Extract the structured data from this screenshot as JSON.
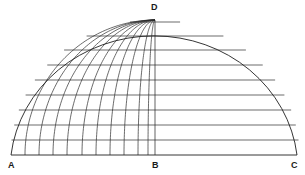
{
  "figure": {
    "type": "geometric-diagram",
    "background_color": "#ffffff",
    "line_color": "#2b2b2b",
    "outline_color": "#1f1f1f",
    "label_color": "#1a1a1a",
    "canvas": {
      "width": 305,
      "height": 175
    }
  },
  "geometry": {
    "center_x": 155,
    "baseline_y": 155,
    "apex_y": 20,
    "radius_x": 144,
    "radius_y": 135,
    "left_edge_x": 11,
    "right_edge_x": 297,
    "meridian_count": 10,
    "meridian_base_spacing_px": 14,
    "latitude_count": 9,
    "outline_stroke_width": 0.9,
    "grid_stroke_width": 0.7
  },
  "latitudes": {
    "description": "Horizontal chord lines measured from the baseline upward",
    "y_values": [
      22,
      36,
      50,
      65,
      80,
      95,
      110,
      125,
      140
    ]
  },
  "meridians": {
    "description": "Longitude arcs on the left half, converging at apex D",
    "base_x_values": [
      25,
      39,
      53,
      67,
      82,
      96,
      110,
      124,
      138,
      148
    ]
  },
  "labels": {
    "A": {
      "text": "A",
      "x": 8,
      "y": 160,
      "role": "left-base-vertex"
    },
    "B": {
      "text": "B",
      "x": 152,
      "y": 160,
      "role": "center-base-vertex"
    },
    "C": {
      "text": "C",
      "x": 291,
      "y": 160,
      "role": "right-base-vertex"
    },
    "D": {
      "text": "D",
      "x": 151,
      "y": 2,
      "role": "apex-vertex"
    }
  }
}
